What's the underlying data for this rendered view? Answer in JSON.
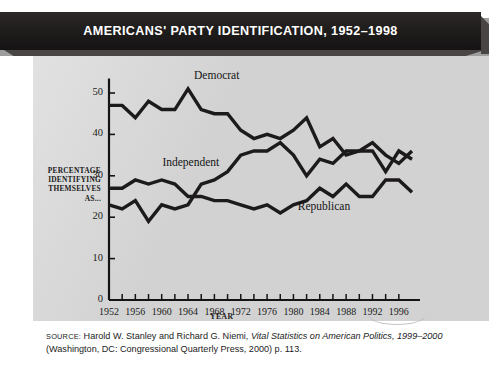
{
  "banner": {
    "title": "AMERICANS' PARTY IDENTIFICATION, 1952–1998"
  },
  "axes": {
    "ylabel": "PERCENTAGE IDENTIFYING THEMSELVES AS...",
    "ylabel_lines": [
      "PERCENTAGE",
      "IDENTIFYING",
      "THEMSELVES",
      "AS..."
    ],
    "xlabel": "YEAR",
    "yticks": [
      0,
      10,
      20,
      30,
      40,
      50
    ],
    "xticks_labeled": [
      1952,
      1956,
      1960,
      1964,
      1968,
      1972,
      1976,
      1980,
      1984,
      1988,
      1992,
      1996
    ],
    "xticks_minor_step": 2
  },
  "series_labels": {
    "democrat": "Democrat",
    "independent": "Independent",
    "republican": "Republican"
  },
  "source": {
    "prefix": "SOURCE:",
    "line1_a": " Harold W. Stanley and Richard G. Niemi, ",
    "line1_italic": "Vital Statistics on American Politics, 1999–2000",
    "line2": "(Washington, DC: Congressional Quarterly Press, 2000) p. 113."
  },
  "colors": {
    "banner_bg": "#231f1f",
    "banner_text": "#ffffff",
    "panel_bg": "#d2d2d2",
    "line": "#1c1a1a",
    "axis": "#141414",
    "page_bg": "#ffffff"
  },
  "chart_data": {
    "type": "line",
    "title": "AMERICANS' PARTY IDENTIFICATION, 1952–1998",
    "xlabel": "YEAR",
    "ylabel": "PERCENTAGE IDENTIFYING THEMSELVES AS...",
    "xlim": [
      1952,
      1998
    ],
    "ylim": [
      0,
      55
    ],
    "yticks": [
      0,
      10,
      20,
      30,
      40,
      50
    ],
    "grid": false,
    "legend": "inline-labels",
    "x": [
      1952,
      1954,
      1956,
      1958,
      1960,
      1962,
      1964,
      1966,
      1968,
      1970,
      1972,
      1974,
      1976,
      1978,
      1980,
      1982,
      1984,
      1986,
      1988,
      1990,
      1992,
      1994,
      1996,
      1998
    ],
    "series": [
      {
        "name": "Democrat",
        "values": [
          47,
          47,
          44,
          48,
          46,
          46,
          51,
          46,
          45,
          45,
          41,
          39,
          40,
          39,
          41,
          44,
          37,
          39,
          35,
          36,
          36,
          31,
          36,
          34
        ]
      },
      {
        "name": "Independent",
        "values": [
          23,
          22,
          24,
          19,
          23,
          22,
          23,
          28,
          29,
          31,
          35,
          36,
          36,
          38,
          35,
          30,
          34,
          33,
          36,
          36,
          38,
          35,
          33,
          36
        ]
      },
      {
        "name": "Republican",
        "values": [
          27,
          27,
          29,
          28,
          29,
          28,
          25,
          25,
          24,
          24,
          23,
          22,
          23,
          21,
          23,
          24,
          27,
          25,
          28,
          25,
          25,
          29,
          29,
          26
        ]
      }
    ]
  }
}
